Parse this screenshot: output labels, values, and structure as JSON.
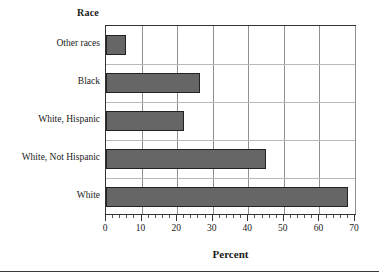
{
  "chart_data": {
    "type": "bar",
    "orientation": "horizontal",
    "title": "Race",
    "xlabel": "Percent",
    "ylabel": "Race",
    "categories": [
      "White",
      "White, Not Hispanic",
      "White, Hispanic",
      "Black",
      "Other races"
    ],
    "values": [
      68,
      45,
      22,
      26.5,
      5.6
    ],
    "xlim": [
      0,
      70
    ],
    "xticks": [
      0,
      10,
      20,
      30,
      40,
      50,
      60,
      70
    ],
    "xticklabels": [
      "0",
      "10",
      "20",
      "30",
      "40",
      "50",
      "60",
      "70"
    ],
    "grid": true,
    "grid_axis": "both",
    "legend": false,
    "bar_color": "#666666",
    "bar_edge_color": "#222222",
    "axis_color": "#333333",
    "gridline_color": "#8f8f8f",
    "background": "#ffffff",
    "bars": [
      {
        "label": "Other races",
        "value": 5.6
      },
      {
        "label": "Black",
        "value": 26.5
      },
      {
        "label": "White, Hispanic",
        "value": 22
      },
      {
        "label": "White, Not Hispanic",
        "value": 45
      },
      {
        "label": "White",
        "value": 68
      }
    ]
  }
}
